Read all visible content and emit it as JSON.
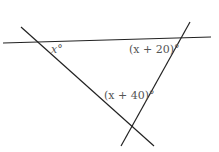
{
  "diagram": {
    "labels": {
      "angle_1": "x°",
      "angle_2": "(x + 20)°",
      "angle_3": "(x + 40)°"
    },
    "colors": {
      "line": "#222222",
      "text": "#555555",
      "background": "#ffffff"
    }
  }
}
